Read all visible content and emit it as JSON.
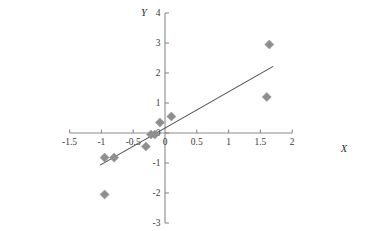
{
  "chart_data": {
    "type": "scatter",
    "title": "",
    "xlabel": "X",
    "ylabel": "Y",
    "xlim": [
      -1.5,
      2
    ],
    "ylim": [
      -3,
      4
    ],
    "grid": false,
    "legend": "none",
    "x_ticks": [
      -1.5,
      -1,
      -0.5,
      0,
      0.5,
      1,
      1.5,
      2
    ],
    "x_tick_labels": [
      "-1.5",
      "-1",
      "-0.5",
      "0",
      "0.5",
      "1",
      "1.5",
      "2"
    ],
    "y_ticks": [
      -3,
      -2,
      -1,
      0,
      1,
      2,
      3,
      4
    ],
    "y_tick_labels": [
      "-3",
      "-2",
      "-1",
      "0",
      "1",
      "2",
      "3",
      "4"
    ],
    "series": [
      {
        "name": "observations",
        "marker": "diamond",
        "color": "#8f8f8f",
        "points": [
          {
            "x": -0.95,
            "y": -0.82
          },
          {
            "x": -0.8,
            "y": -0.82
          },
          {
            "x": -0.95,
            "y": -2.05
          },
          {
            "x": -0.3,
            "y": -0.45
          },
          {
            "x": -0.22,
            "y": -0.05
          },
          {
            "x": -0.16,
            "y": -0.05
          },
          {
            "x": -0.08,
            "y": 0.35
          },
          {
            "x": 0.1,
            "y": 0.55
          },
          {
            "x": 1.6,
            "y": 1.2
          },
          {
            "x": 1.64,
            "y": 2.95
          }
        ]
      }
    ],
    "trend_line": {
      "name": "fitted regression line",
      "color": "#4a4a4a",
      "x_start": -1.02,
      "y_start": -1.07,
      "x_end": 1.7,
      "y_end": 2.22
    }
  },
  "axis_names": {
    "x": "X",
    "y": "Y"
  }
}
